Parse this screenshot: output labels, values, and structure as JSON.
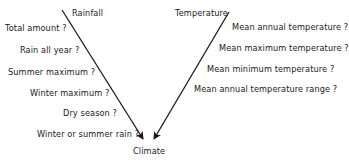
{
  "diagram": {
    "left_branch": {
      "title": "Rainfall",
      "questions": [
        "Total amount ?",
        "Rain all year ?",
        "Summer maximum ?",
        "Winter maximum ?",
        "Dry season ?",
        "Winter or summer rain ?"
      ]
    },
    "right_branch": {
      "title": "Temperature",
      "questions": [
        "Mean annual temperature ?",
        "Mean maximum temperature ?",
        "Mean minimum temperature ?",
        "Mean annual temperature range ?"
      ]
    },
    "target": "Climate",
    "colors": {
      "ink": "#1a1a1a",
      "background": "#ffffff"
    }
  }
}
